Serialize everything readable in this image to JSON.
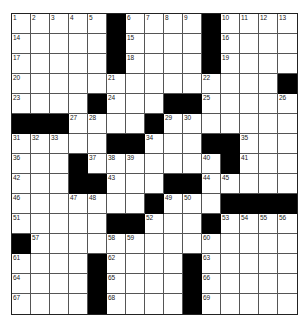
{
  "puzzle": {
    "rows": 15,
    "cols": 15,
    "colors": {
      "block": "#000000",
      "cell": "#ffffff",
      "line": "#555555"
    },
    "layout": [
      "1,2,3,4,5,#,6,7,8,9,#,10,11,12,13",
      "14,.,.,.,.,#,15,.,.,.,#,16,.,.,.",
      "17,.,.,.,.,#,18,.,.,.,#,19,.,.,.",
      "20,.,.,.,.,21,.,.,.,.,22,.,.,.,#",
      "23,.,.,.,#,24,.,.,#,#,25,.,.,.,26",
      "#,#,#,27,28,.,.,#,29,30,.,.,.,.,.",
      "31,32,33,.,.,#,#,34,.,.,#,#,35,.,.",
      "36,.,.,#,37,38,39,.,.,.,40,#,41,.,.",
      "42,.,.,#,#,43,.,.,#,#,44,45,.,.,.",
      "46,.,.,47,48,.,.,#,49,50,.,#,#,#,#",
      "51,.,.,.,.,#,#,52,.,.,#,53,54,55,56",
      "#,57,.,.,.,58,59,.,.,.,60,.,.,.,.",
      "61,.,.,.,#,62,.,.,.,#,63,.,.,.,.",
      "64,.,.,.,#,65,.,.,.,#,66,.,.,.,.",
      "67,.,.,.,#,68,.,.,.,#,69,.,.,.,."
    ]
  }
}
